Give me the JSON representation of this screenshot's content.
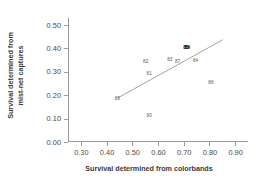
{
  "chart_data": {
    "type": "scatter",
    "title": "",
    "xlabel": "Survival determined from colorbands",
    "ylabel": "Survival determined from mist-net captures",
    "ylabel_lines": [
      "Survival determined from",
      "mist-net captures"
    ],
    "xlim": [
      0.25,
      0.95
    ],
    "ylim": [
      0.0,
      0.53
    ],
    "xticks": [
      0.3,
      0.4,
      0.5,
      0.6,
      0.7,
      0.8,
      0.9
    ],
    "xtick_labels": [
      "0.30",
      "0.40",
      "0.50",
      "0.60",
      "0.70",
      "0.80",
      "0.90"
    ],
    "yticks": [
      0.0,
      0.1,
      0.2,
      0.3,
      0.4,
      0.5
    ],
    "ytick_labels": [
      "0.00",
      "0.10",
      "0.20",
      "0.30",
      "0.40",
      "0.50"
    ],
    "grid": false,
    "legend": "none",
    "point_style": "text-labels",
    "points": [
      {
        "label": "88",
        "x": 0.442,
        "y": 0.19,
        "emphasis": false
      },
      {
        "label": "82",
        "x": 0.552,
        "y": 0.347,
        "emphasis": false
      },
      {
        "label": "81",
        "x": 0.566,
        "y": 0.295,
        "emphasis": false
      },
      {
        "label": "90",
        "x": 0.566,
        "y": 0.117,
        "emphasis": false
      },
      {
        "label": "83",
        "x": 0.646,
        "y": 0.355,
        "emphasis": false
      },
      {
        "label": "87",
        "x": 0.676,
        "y": 0.347,
        "emphasis": false
      },
      {
        "label": "85",
        "x": 0.709,
        "y": 0.408,
        "emphasis": true
      },
      {
        "label": "89",
        "x": 0.714,
        "y": 0.406,
        "emphasis": true
      },
      {
        "label": "84",
        "x": 0.746,
        "y": 0.35,
        "emphasis": false
      },
      {
        "label": "86",
        "x": 0.806,
        "y": 0.255,
        "emphasis": false
      }
    ],
    "trendline": {
      "type": "linear-fit",
      "x_start": 0.443,
      "y_start": 0.188,
      "x_end": 0.852,
      "y_end": 0.437
    }
  }
}
